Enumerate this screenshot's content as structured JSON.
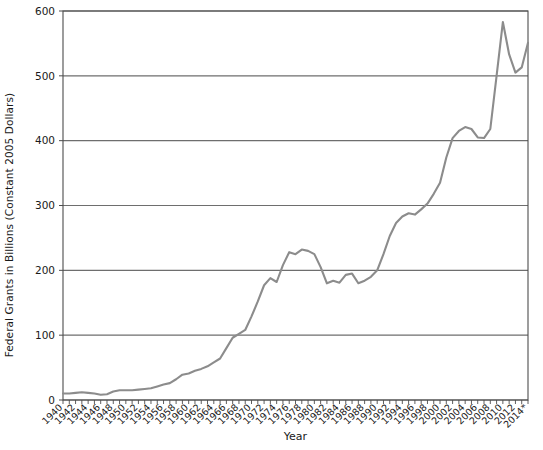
{
  "chart_data": {
    "type": "line",
    "title": "",
    "xlabel": "Year",
    "ylabel": "Federal Grants in Billions (Constant 2005 Dollars)",
    "xlim": [
      1940,
      2014
    ],
    "ylim": [
      0,
      600
    ],
    "y_ticks": [
      0,
      100,
      200,
      300,
      400,
      500,
      600
    ],
    "x_ticks": [
      1940,
      1942,
      1944,
      1946,
      1948,
      1950,
      1952,
      1954,
      1956,
      1958,
      1960,
      1962,
      1964,
      1966,
      1968,
      1970,
      1972,
      1974,
      1976,
      1978,
      1980,
      1982,
      1984,
      1986,
      1988,
      1990,
      1992,
      1994,
      1996,
      1998,
      2000,
      2002,
      2004,
      2006,
      2008,
      2010,
      2012,
      2014
    ],
    "x_tick_labels": [
      "1940",
      "1942",
      "1944",
      "1946",
      "1948",
      "1950",
      "1952",
      "1954",
      "1956",
      "1958",
      "1960",
      "1962",
      "1964",
      "1966",
      "1968",
      "1970",
      "1972",
      "1974",
      "1976",
      "1978",
      "1980",
      "1982",
      "1984",
      "1986",
      "1988",
      "1990",
      "1992",
      "1994",
      "1996",
      "1998",
      "2000",
      "2002",
      "2004",
      "2006",
      "2008",
      "2010",
      "2012",
      "2014*"
    ],
    "grid": true,
    "grid_axis": "y",
    "legend": false,
    "series": [
      {
        "name": "Federal Grants",
        "color": "#8c8c8c",
        "x": [
          1940,
          1941,
          1942,
          1943,
          1944,
          1945,
          1946,
          1947,
          1948,
          1949,
          1950,
          1951,
          1952,
          1953,
          1954,
          1955,
          1956,
          1957,
          1958,
          1959,
          1960,
          1961,
          1962,
          1963,
          1964,
          1965,
          1966,
          1967,
          1968,
          1969,
          1970,
          1971,
          1972,
          1973,
          1974,
          1975,
          1976,
          1977,
          1978,
          1979,
          1980,
          1981,
          1982,
          1983,
          1984,
          1985,
          1986,
          1987,
          1988,
          1989,
          1990,
          1991,
          1992,
          1993,
          1994,
          1995,
          1996,
          1997,
          1998,
          1999,
          2000,
          2001,
          2002,
          2003,
          2004,
          2005,
          2006,
          2007,
          2008,
          2009,
          2010,
          2011,
          2012,
          2013,
          2014
        ],
        "values": [
          10,
          10,
          11,
          12,
          11,
          10,
          8,
          9,
          13,
          15,
          15,
          15,
          16,
          17,
          18,
          21,
          24,
          26,
          32,
          39,
          41,
          45,
          48,
          52,
          58,
          64,
          80,
          96,
          102,
          108,
          129,
          152,
          177,
          188,
          182,
          208,
          228,
          225,
          232,
          230,
          225,
          205,
          180,
          184,
          181,
          193,
          195,
          180,
          184,
          190,
          200,
          225,
          253,
          273,
          283,
          288,
          286,
          294,
          303,
          318,
          335,
          374,
          404,
          415,
          421,
          418,
          405,
          404,
          418,
          500,
          583,
          533,
          505,
          513,
          551
        ]
      }
    ],
    "footnote_marker": "*"
  },
  "axis": {
    "y_title": "Federal Grants in Billions (Constant 2005 Dollars)",
    "x_title": "Year"
  },
  "style": {
    "line_color": "#8c8c8c",
    "grid_color": "#6e6e6e",
    "axis_color": "#4d4d4d",
    "background": "#ffffff"
  }
}
